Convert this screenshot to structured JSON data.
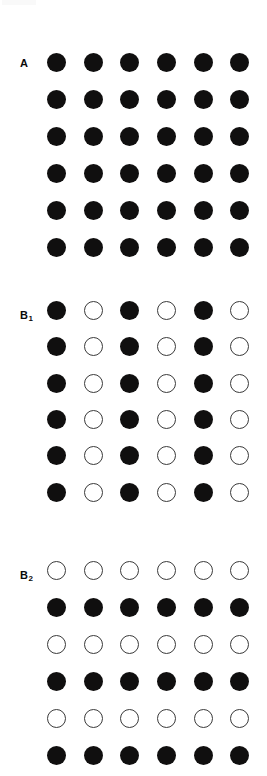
{
  "figure": {
    "background_color": "#ffffff",
    "width": 267,
    "height": 776,
    "filled_color": "#100f0f",
    "open_stroke_color": "#3a3a3a",
    "dot_diameter": 19,
    "columns_x": [
      56,
      93,
      129.5,
      166,
      203,
      239.5
    ],
    "crop_artifact_present": true
  },
  "chart_data": {
    "type": "scatter",
    "title": "",
    "subtitle": "",
    "xlabel": "",
    "ylabel": "",
    "grid": false,
    "legend": "none",
    "marker_states": [
      "filled",
      "open"
    ],
    "rows": 6,
    "cols": 6,
    "panels": [
      {
        "id": "A",
        "label": "A",
        "label_text": "A",
        "label_sub": "",
        "label_x": 20,
        "label_y": 58,
        "grouping": "none",
        "pattern_description": "All 36 circles filled; homogeneous lattice with no grouping.",
        "rows_y": [
          62,
          99,
          136,
          173,
          210,
          247
        ],
        "matrix": [
          [
            "filled",
            "filled",
            "filled",
            "filled",
            "filled",
            "filled"
          ],
          [
            "filled",
            "filled",
            "filled",
            "filled",
            "filled",
            "filled"
          ],
          [
            "filled",
            "filled",
            "filled",
            "filled",
            "filled",
            "filled"
          ],
          [
            "filled",
            "filled",
            "filled",
            "filled",
            "filled",
            "filled"
          ],
          [
            "filled",
            "filled",
            "filled",
            "filled",
            "filled",
            "filled"
          ],
          [
            "filled",
            "filled",
            "filled",
            "filled",
            "filled",
            "filled"
          ]
        ]
      },
      {
        "id": "B1",
        "label": "B",
        "label_text": "B",
        "label_sub": "1",
        "label_x": 20,
        "label_y": 310,
        "grouping": "columns",
        "pattern_description": "Alternating filled and open columns producing vertical stripe grouping.",
        "rows_y": [
          310,
          346.5,
          383,
          419,
          455.5,
          492
        ],
        "matrix": [
          [
            "filled",
            "open",
            "filled",
            "open",
            "filled",
            "open"
          ],
          [
            "filled",
            "open",
            "filled",
            "open",
            "filled",
            "open"
          ],
          [
            "filled",
            "open",
            "filled",
            "open",
            "filled",
            "open"
          ],
          [
            "filled",
            "open",
            "filled",
            "open",
            "filled",
            "open"
          ],
          [
            "filled",
            "open",
            "filled",
            "open",
            "filled",
            "open"
          ],
          [
            "filled",
            "open",
            "filled",
            "open",
            "filled",
            "open"
          ]
        ]
      },
      {
        "id": "B2",
        "label": "B",
        "label_text": "B",
        "label_sub": "2",
        "label_x": 20,
        "label_y": 570,
        "grouping": "rows",
        "pattern_description": "Alternating open and filled rows producing horizontal stripe grouping.",
        "rows_y": [
          570,
          607,
          644,
          681,
          718,
          755
        ],
        "matrix": [
          [
            "open",
            "open",
            "open",
            "open",
            "open",
            "open"
          ],
          [
            "filled",
            "filled",
            "filled",
            "filled",
            "filled",
            "filled"
          ],
          [
            "open",
            "open",
            "open",
            "open",
            "open",
            "open"
          ],
          [
            "filled",
            "filled",
            "filled",
            "filled",
            "filled",
            "filled"
          ],
          [
            "open",
            "open",
            "open",
            "open",
            "open",
            "open"
          ],
          [
            "filled",
            "filled",
            "filled",
            "filled",
            "filled",
            "filled"
          ]
        ]
      }
    ]
  }
}
